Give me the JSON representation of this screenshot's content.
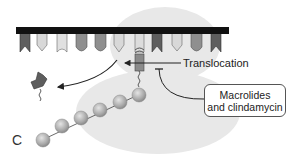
{
  "diagram": {
    "panel_letter": "C",
    "labels": {
      "translocation": "Translocation",
      "drug_line1": "Macrolides",
      "drug_line2": "and clindamycin"
    },
    "elements": {
      "mrna": "mRNA strand (black bar)",
      "ribosome": "ribosome (light gray background)",
      "trna_count": 11,
      "peptide_beads": 6
    },
    "colors": {
      "mrna": "#111111",
      "ribosome": "#e6e6e6",
      "trna_dark": "#5e5e5e",
      "trna_medium": "#8f8f8f",
      "trna_light": "#d8d8d8",
      "bead": "#b5b5b5",
      "arrow": "#222222"
    }
  }
}
